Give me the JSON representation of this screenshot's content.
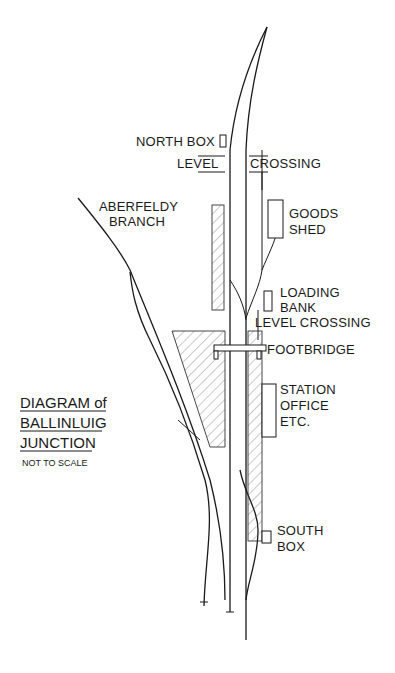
{
  "diagram": {
    "title_lines": [
      "DIAGRAM of",
      "BALLINLUIG",
      "JUNCTION"
    ],
    "subtitle": "NOT TO SCALE",
    "labels": {
      "north_box": "NORTH BOX",
      "level_left": "LEVEL",
      "crossing_right": "CROSSING",
      "aberfeldy_1": "ABERFELDY",
      "aberfeldy_2": "BRANCH",
      "goods_1": "GOODS",
      "goods_2": "SHED",
      "loading_1": "LOADING",
      "loading_2": "BANK",
      "level_crossing_2": "LEVEL CROSSING",
      "footbridge": "FOOTBRIDGE",
      "station_1": "STATION",
      "station_2": "OFFICE",
      "station_3": "ETC.",
      "south_1": "SOUTH",
      "south_2": "BOX"
    },
    "colors": {
      "ink": "#1a1a1a",
      "background": "#ffffff",
      "hatch": "#555555"
    }
  }
}
